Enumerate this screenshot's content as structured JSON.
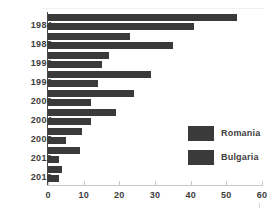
{
  "chart_data": {
    "type": "bar",
    "orientation": "horizontal",
    "title": "",
    "subtitle": "",
    "xlabel": "",
    "ylabel": "",
    "xlim": [
      0,
      60
    ],
    "xticks": [
      0,
      10,
      20,
      30,
      40,
      50,
      60
    ],
    "xtick_labels": [
      "0",
      "10",
      "20",
      "30",
      "40",
      "50",
      "60"
    ],
    "grid": false,
    "legend_position": "right",
    "categories": [
      "1984",
      "1988",
      "1992",
      "1996",
      "2000",
      "2004",
      "2008",
      "2012",
      "2016"
    ],
    "series": [
      {
        "name": "Romania",
        "color": "#3a3a3a",
        "values": [
          53,
          23,
          17,
          29,
          24,
          19,
          9.5,
          9,
          4
        ]
      },
      {
        "name": "Bulgaria",
        "color": "#3a3a3a",
        "values": [
          41,
          35,
          15,
          14,
          12,
          12,
          5,
          3,
          3
        ]
      }
    ]
  },
  "legend": {
    "items": [
      {
        "label": "Romania",
        "color": "#3a3a3a"
      },
      {
        "label": "Bulgaria",
        "color": "#3a3a3a"
      }
    ]
  },
  "axis": {
    "tick_labels": [
      "0",
      "10",
      "20",
      "30",
      "40",
      "50",
      "60"
    ],
    "year_labels": [
      "1984",
      "1988",
      "1992",
      "1996",
      "2000",
      "2004",
      "2008",
      "2012",
      "2016"
    ]
  },
  "colors": {
    "bar": "#3a3a3a",
    "text": "#3d3d3d",
    "axis": "#c8c8c8",
    "y_axis": "#4a4a4a",
    "background": "#ffffff"
  }
}
